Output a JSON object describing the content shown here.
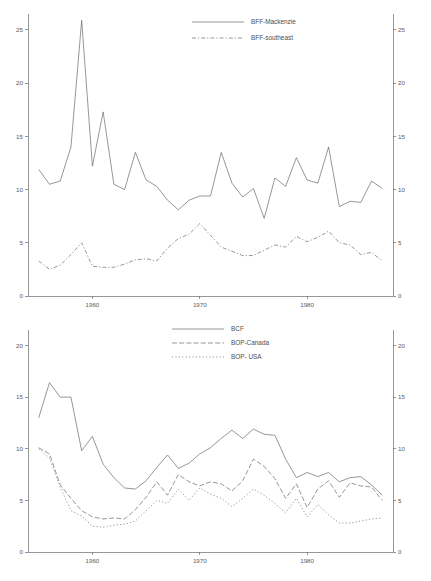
{
  "chart_data": [
    {
      "id": "top",
      "type": "line",
      "title": "",
      "xlabel": "",
      "ylabel": "",
      "xlim": [
        1954,
        1988
      ],
      "ylim": [
        0,
        26.5
      ],
      "yticks": [
        0,
        5,
        10,
        15,
        20,
        25
      ],
      "ytick_labels": [
        "0",
        "5",
        "10",
        "15",
        "20",
        "25"
      ],
      "xticks": [
        1960,
        1970,
        1980
      ],
      "xtick_labels": [
        "1960",
        "1970",
        "1980"
      ],
      "grid": false,
      "right_axis": true,
      "right_ytick_labels": [
        "0",
        "5",
        "10",
        "15",
        "20",
        "25"
      ],
      "legend_position": "top-center",
      "legend": [
        {
          "label": "BFF-Mackenzie",
          "dash": "none"
        },
        {
          "label": "BFF-southeast",
          "dash": "dashdot"
        }
      ],
      "x": [
        1955,
        1956,
        1957,
        1958,
        1959,
        1960,
        1961,
        1962,
        1963,
        1964,
        1965,
        1966,
        1967,
        1968,
        1969,
        1970,
        1971,
        1972,
        1973,
        1974,
        1975,
        1976,
        1977,
        1978,
        1979,
        1980,
        1981,
        1982,
        1983,
        1984,
        1985,
        1986,
        1987
      ],
      "series": [
        {
          "name": "BFF-Mackenzie",
          "dash": "none",
          "values": [
            11.9,
            10.5,
            10.8,
            14.0,
            25.9,
            12.2,
            17.3,
            10.5,
            10.0,
            13.5,
            10.9,
            10.3,
            9.0,
            8.1,
            9.0,
            9.4,
            9.4,
            13.5,
            10.6,
            9.3,
            10.1,
            7.3,
            11.1,
            10.3,
            13.0,
            10.9,
            10.6,
            14.0,
            8.4,
            8.9,
            8.8,
            10.8,
            10.1
          ]
        },
        {
          "name": "BFF-southeast",
          "dash": "dashdot",
          "values": [
            3.3,
            2.5,
            2.9,
            3.9,
            5.0,
            2.8,
            2.7,
            2.7,
            3.0,
            3.4,
            3.5,
            3.3,
            4.5,
            5.4,
            5.8,
            6.8,
            5.7,
            4.6,
            4.2,
            3.8,
            3.8,
            4.3,
            4.8,
            4.6,
            5.6,
            5.1,
            5.5,
            6.1,
            5.0,
            4.8,
            3.9,
            4.1,
            3.3,
            3.4,
            3.9
          ]
        }
      ]
    },
    {
      "id": "bottom",
      "type": "line",
      "title": "",
      "xlabel": "",
      "ylabel": "",
      "xlim": [
        1954,
        1988
      ],
      "ylim": [
        0,
        21.5
      ],
      "yticks": [
        0,
        5,
        10,
        15,
        20
      ],
      "ytick_labels": [
        "0",
        "5",
        "10",
        "15",
        "20"
      ],
      "xticks": [
        1960,
        1970,
        1980
      ],
      "xtick_labels": [
        "1960",
        "1970",
        "1980"
      ],
      "grid": false,
      "right_axis": true,
      "right_ytick_labels": [
        "0",
        "5",
        "10",
        "15",
        "20"
      ],
      "legend_position": "top-center",
      "legend": [
        {
          "label": "BCF",
          "dash": "none"
        },
        {
          "label": "BOP-Canada",
          "dash": "dashed"
        },
        {
          "label": "BOP- USA",
          "dash": "dotted"
        }
      ],
      "x": [
        1955,
        1956,
        1957,
        1958,
        1959,
        1960,
        1961,
        1962,
        1963,
        1964,
        1965,
        1966,
        1967,
        1968,
        1969,
        1970,
        1971,
        1972,
        1973,
        1974,
        1975,
        1976,
        1977,
        1978,
        1979,
        1980,
        1981,
        1982,
        1983,
        1984,
        1985,
        1986,
        1987
      ],
      "series": [
        {
          "name": "BCF",
          "dash": "none",
          "values": [
            13.0,
            16.4,
            15.0,
            15.0,
            9.8,
            11.2,
            8.5,
            7.2,
            6.2,
            6.1,
            6.9,
            8.2,
            9.4,
            8.1,
            8.6,
            9.5,
            10.1,
            11.0,
            11.8,
            11.0,
            11.9,
            11.4,
            11.3,
            9.0,
            7.2,
            7.7,
            7.3,
            7.7,
            6.8,
            7.2,
            7.3,
            6.5,
            5.5
          ]
        },
        {
          "name": "BOP-Canada",
          "dash": "dashed",
          "values": [
            10.1,
            9.5,
            6.5,
            5.2,
            4.0,
            3.4,
            3.2,
            3.3,
            3.2,
            4.1,
            5.3,
            6.8,
            5.5,
            7.5,
            6.8,
            6.4,
            6.8,
            6.6,
            5.9,
            6.9,
            9.0,
            8.3,
            7.1,
            5.2,
            6.6,
            4.3,
            6.1,
            6.9,
            5.3,
            6.7,
            6.4,
            6.3,
            5.0
          ]
        },
        {
          "name": "BOP- USA",
          "dash": "dotted",
          "values": [
            10.0,
            9.1,
            6.3,
            4.0,
            3.5,
            2.5,
            2.4,
            2.6,
            2.7,
            3.0,
            4.0,
            5.0,
            4.7,
            6.1,
            5.0,
            6.2,
            5.6,
            5.2,
            4.4,
            5.2,
            6.1,
            5.5,
            4.7,
            3.8,
            5.2,
            3.4,
            4.6,
            3.6,
            2.8,
            2.8,
            3.0,
            3.2,
            3.3
          ]
        }
      ]
    }
  ]
}
